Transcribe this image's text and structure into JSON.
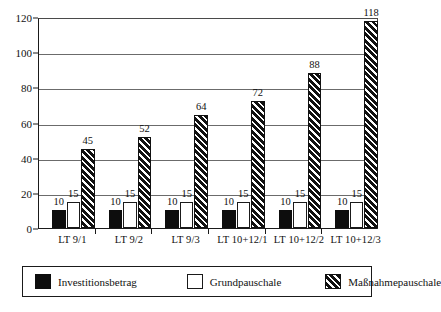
{
  "chart_data": {
    "type": "bar",
    "title": "",
    "subtitle": "",
    "xlabel": "",
    "ylabel": "",
    "ylim": [
      0,
      120
    ],
    "ytick_step": 20,
    "yticks": [
      0,
      20,
      40,
      60,
      80,
      100,
      120
    ],
    "ytick_labels": [
      "0",
      "20",
      "40",
      "60",
      "80",
      "100",
      "120"
    ],
    "grid": "horizontal",
    "legend_position": "below-axes",
    "grouping": "grouped",
    "data_labels": true,
    "categories": [
      "LT 9/1",
      "LT 9/2",
      "LT 9/3",
      "LT 10+12/1",
      "LT 10+12/2",
      "LT 10+12/3"
    ],
    "series": [
      {
        "name": "Investitionsbetrag",
        "fill": "solid-black",
        "color": "#0d0d0d",
        "values": [
          10,
          10,
          10,
          10,
          10,
          10
        ]
      },
      {
        "name": "Grundpauschale",
        "fill": "white-outlined",
        "color": "#ffffff",
        "values": [
          15,
          15,
          15,
          15,
          15,
          15
        ]
      },
      {
        "name": "Maßnahmepauschale",
        "fill": "diagonal-hatch",
        "color": "#111111",
        "values": [
          45,
          52,
          64,
          72,
          88,
          118
        ]
      }
    ]
  },
  "legend": {
    "entries": [
      {
        "label": "Investitionsbetrag"
      },
      {
        "label": "Grundpauschale"
      },
      {
        "label": "Maßnahmepauschale"
      }
    ]
  }
}
